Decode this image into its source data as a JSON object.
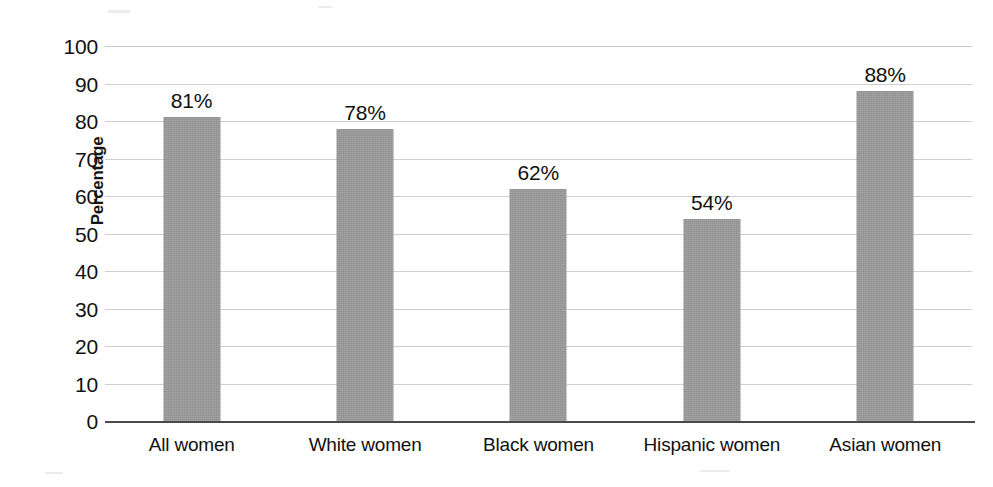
{
  "chart_data": {
    "type": "bar",
    "title": "",
    "subtitle": "",
    "xlabel": "",
    "ylabel": "Percentage",
    "categories": [
      "All women",
      "White women",
      "Black women",
      "Hispanic women",
      "Asian women"
    ],
    "values": [
      81,
      78,
      62,
      54,
      88
    ],
    "data_labels": [
      "81%",
      "78%",
      "62%",
      "54%",
      "88%"
    ],
    "ylim": [
      0,
      100
    ],
    "ytick_step": 10,
    "yticks": [
      100,
      90,
      80,
      70,
      60,
      50,
      40,
      30,
      20,
      10,
      0
    ],
    "ytick_labels": [
      "100",
      "90",
      "80",
      "70",
      "60",
      "50",
      "40",
      "30",
      "20",
      "10",
      "0"
    ],
    "grid": true,
    "grid_axis": "y",
    "legend": false,
    "legend_position": "none",
    "series": [
      {
        "name": "Percentage",
        "values": [
          81,
          78,
          62,
          54,
          88
        ]
      }
    ],
    "colors": {
      "bar_fill": "#9a9a9a",
      "gridline": "#cfcfcf",
      "axis_line": "#4a4a4a",
      "text": "#111111",
      "background": "#ffffff"
    }
  }
}
